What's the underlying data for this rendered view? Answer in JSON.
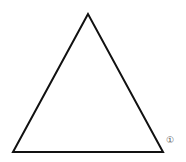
{
  "diagram": {
    "shape": "triangle",
    "stroke_color": "#111111",
    "stroke_width": 2,
    "vertices": {
      "apex": [
        88,
        14
      ],
      "bottom_left": [
        13,
        152
      ],
      "bottom_right": [
        163,
        152
      ]
    },
    "labels": [
      {
        "text": "①",
        "x": 166,
        "y": 136
      }
    ]
  }
}
